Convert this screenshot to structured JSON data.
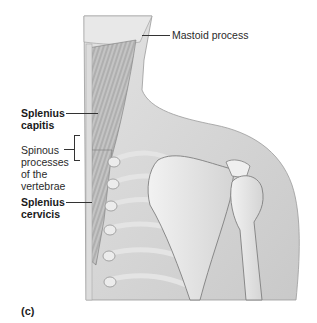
{
  "figure": {
    "panel_label": "(c)",
    "labels": {
      "mastoid_process": "Mastoid process",
      "splenius_capitis_line1": "Splenius",
      "splenius_capitis_line2": "capitis",
      "spinous_line1": "Spinous",
      "spinous_line2": "processes",
      "spinous_line3": "of the",
      "spinous_line4": "vertebrae",
      "splenius_cervicis_line1": "Splenius",
      "splenius_cervicis_line2": "cervicis"
    },
    "colors": {
      "skin": "#d6d6d6",
      "skin_light": "#e6e6e6",
      "muscle": "#b8b8b8",
      "bone": "#ececec",
      "outline": "#8a8a8a",
      "leader": "#333333"
    }
  }
}
